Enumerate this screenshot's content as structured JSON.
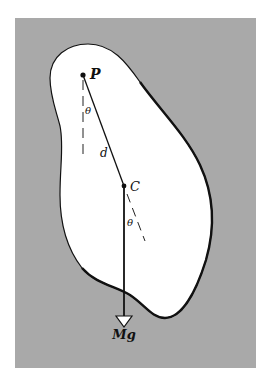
{
  "diagram": {
    "type": "physical-pendulum",
    "colors": {
      "page_background": "#ffffff",
      "panel_background": "#a9a9a9",
      "body_fill": "#ffffff",
      "outline": "#111111"
    },
    "labels": {
      "pivot": "P",
      "center_of_mass": "C",
      "distance": "d",
      "angle_at_pivot": "θ",
      "angle_at_center": "θ",
      "weight_force": "Mg"
    }
  }
}
